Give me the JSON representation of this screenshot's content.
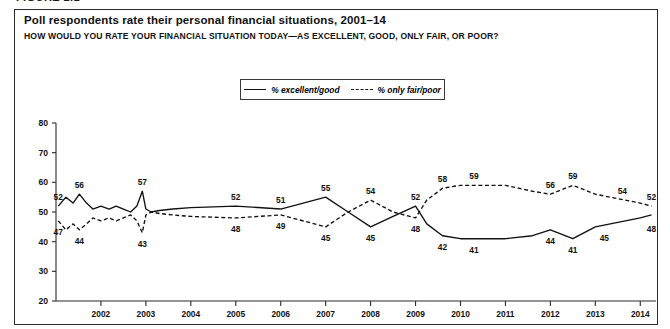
{
  "figure_caption": "FIGURE 2.1",
  "title": "Poll respondents rate their personal financial situations, 2001–14",
  "subtitle": "HOW WOULD YOU RATE YOUR FINANCIAL SITUATION TODAY—AS EXCELLENT, GOOD, ONLY FAIR, OR POOR?",
  "legend": {
    "series_1": "% excellent/good",
    "series_2": "% only fair/poor"
  },
  "chart_data": {
    "type": "line",
    "title": "Poll respondents rate their personal financial situations, 2001–14",
    "subtitle": "HOW WOULD YOU RATE YOUR FINANCIAL SITUATION TODAY—AS EXCELLENT, GOOD, ONLY FAIR, OR POOR?",
    "xlabel": "",
    "ylabel": "",
    "xlim": [
      2001.0,
      2014.35
    ],
    "ylim": [
      20,
      80
    ],
    "yticks": [
      20,
      30,
      40,
      50,
      60,
      70,
      80
    ],
    "xticks": [
      2002,
      2003,
      2004,
      2005,
      2006,
      2007,
      2008,
      2009,
      2010,
      2011,
      2012,
      2013,
      2014
    ],
    "grid": false,
    "legend_position": "top-center",
    "line_color": "#111111",
    "series": [
      {
        "name": "% excellent/good",
        "style": "solid",
        "x": [
          2001.05,
          2001.22,
          2001.38,
          2001.52,
          2001.68,
          2001.82,
          2002.0,
          2002.18,
          2002.34,
          2002.5,
          2002.66,
          2002.8,
          2002.92,
          2003.0,
          2003.12,
          2003.3,
          2003.6,
          2004.0,
          2005.0,
          2006.0,
          2007.0,
          2007.5,
          2008.0,
          2008.5,
          2009.0,
          2009.25,
          2009.6,
          2010.0,
          2011.0,
          2011.6,
          2012.0,
          2012.5,
          2013.0,
          2014.0,
          2014.25
        ],
        "y": [
          52,
          55,
          53,
          56,
          53,
          51,
          52,
          51,
          52,
          51,
          50,
          52,
          57,
          51,
          50,
          50.5,
          51,
          51.5,
          52,
          51,
          55,
          50,
          45,
          48.5,
          52,
          46,
          42,
          41,
          41,
          42,
          44,
          41,
          45,
          48,
          49
        ],
        "labels": [
          {
            "x": 2001.05,
            "y": 52,
            "text": "52",
            "pos": "above"
          },
          {
            "x": 2001.52,
            "y": 56,
            "text": "56",
            "pos": "above"
          },
          {
            "x": 2005.0,
            "y": 52,
            "text": "52",
            "pos": "above"
          },
          {
            "x": 2002.92,
            "y": 57,
            "text": "57",
            "pos": "above"
          },
          {
            "x": 2006.0,
            "y": 51,
            "text": "51",
            "pos": "above"
          },
          {
            "x": 2007.0,
            "y": 55,
            "text": "55",
            "pos": "above"
          },
          {
            "x": 2008.0,
            "y": 45,
            "text": "45",
            "pos": "below"
          },
          {
            "x": 2009.0,
            "y": 52,
            "text": "52",
            "pos": "above"
          },
          {
            "x": 2009.6,
            "y": 42,
            "text": "42",
            "pos": "below"
          },
          {
            "x": 2010.3,
            "y": 41,
            "text": "41",
            "pos": "below"
          },
          {
            "x": 2012.0,
            "y": 44,
            "text": "44",
            "pos": "below"
          },
          {
            "x": 2012.5,
            "y": 41,
            "text": "41",
            "pos": "below"
          },
          {
            "x": 2013.2,
            "y": 45,
            "text": "45",
            "pos": "below"
          },
          {
            "x": 2014.25,
            "y": 48,
            "text": "48",
            "pos": "below"
          }
        ]
      },
      {
        "name": "% only fair/poor",
        "style": "dashed",
        "x": [
          2001.05,
          2001.22,
          2001.38,
          2001.52,
          2001.68,
          2001.82,
          2002.0,
          2002.18,
          2002.34,
          2002.5,
          2002.66,
          2002.8,
          2002.92,
          2003.0,
          2003.12,
          2003.3,
          2003.6,
          2004.0,
          2005.0,
          2006.0,
          2007.0,
          2007.5,
          2008.0,
          2008.5,
          2009.0,
          2009.25,
          2009.6,
          2010.0,
          2011.0,
          2011.6,
          2012.0,
          2012.5,
          2013.0,
          2014.0,
          2014.25
        ],
        "y": [
          47,
          44,
          46,
          44,
          46,
          48,
          47,
          48,
          47,
          48,
          49,
          47,
          43,
          49,
          50,
          49.5,
          49,
          48.5,
          48,
          49,
          45,
          50,
          54,
          50,
          48,
          54,
          58,
          59,
          59,
          57,
          56,
          59,
          56,
          53,
          52
        ],
        "labels": [
          {
            "x": 2001.05,
            "y": 47,
            "text": "47",
            "pos": "below"
          },
          {
            "x": 2001.52,
            "y": 44,
            "text": "44",
            "pos": "below"
          },
          {
            "x": 2002.92,
            "y": 43,
            "text": "43",
            "pos": "below"
          },
          {
            "x": 2005.0,
            "y": 48,
            "text": "48",
            "pos": "below"
          },
          {
            "x": 2006.0,
            "y": 49,
            "text": "49",
            "pos": "below"
          },
          {
            "x": 2007.0,
            "y": 45,
            "text": "45",
            "pos": "below"
          },
          {
            "x": 2008.0,
            "y": 54,
            "text": "54",
            "pos": "above"
          },
          {
            "x": 2009.0,
            "y": 48,
            "text": "48",
            "pos": "below"
          },
          {
            "x": 2009.6,
            "y": 58,
            "text": "58",
            "pos": "above"
          },
          {
            "x": 2010.3,
            "y": 59,
            "text": "59",
            "pos": "above"
          },
          {
            "x": 2012.0,
            "y": 56,
            "text": "56",
            "pos": "above"
          },
          {
            "x": 2012.5,
            "y": 59,
            "text": "59",
            "pos": "above"
          },
          {
            "x": 2013.6,
            "y": 54,
            "text": "54",
            "pos": "above"
          },
          {
            "x": 2014.25,
            "y": 52,
            "text": "52",
            "pos": "above"
          }
        ]
      }
    ]
  }
}
